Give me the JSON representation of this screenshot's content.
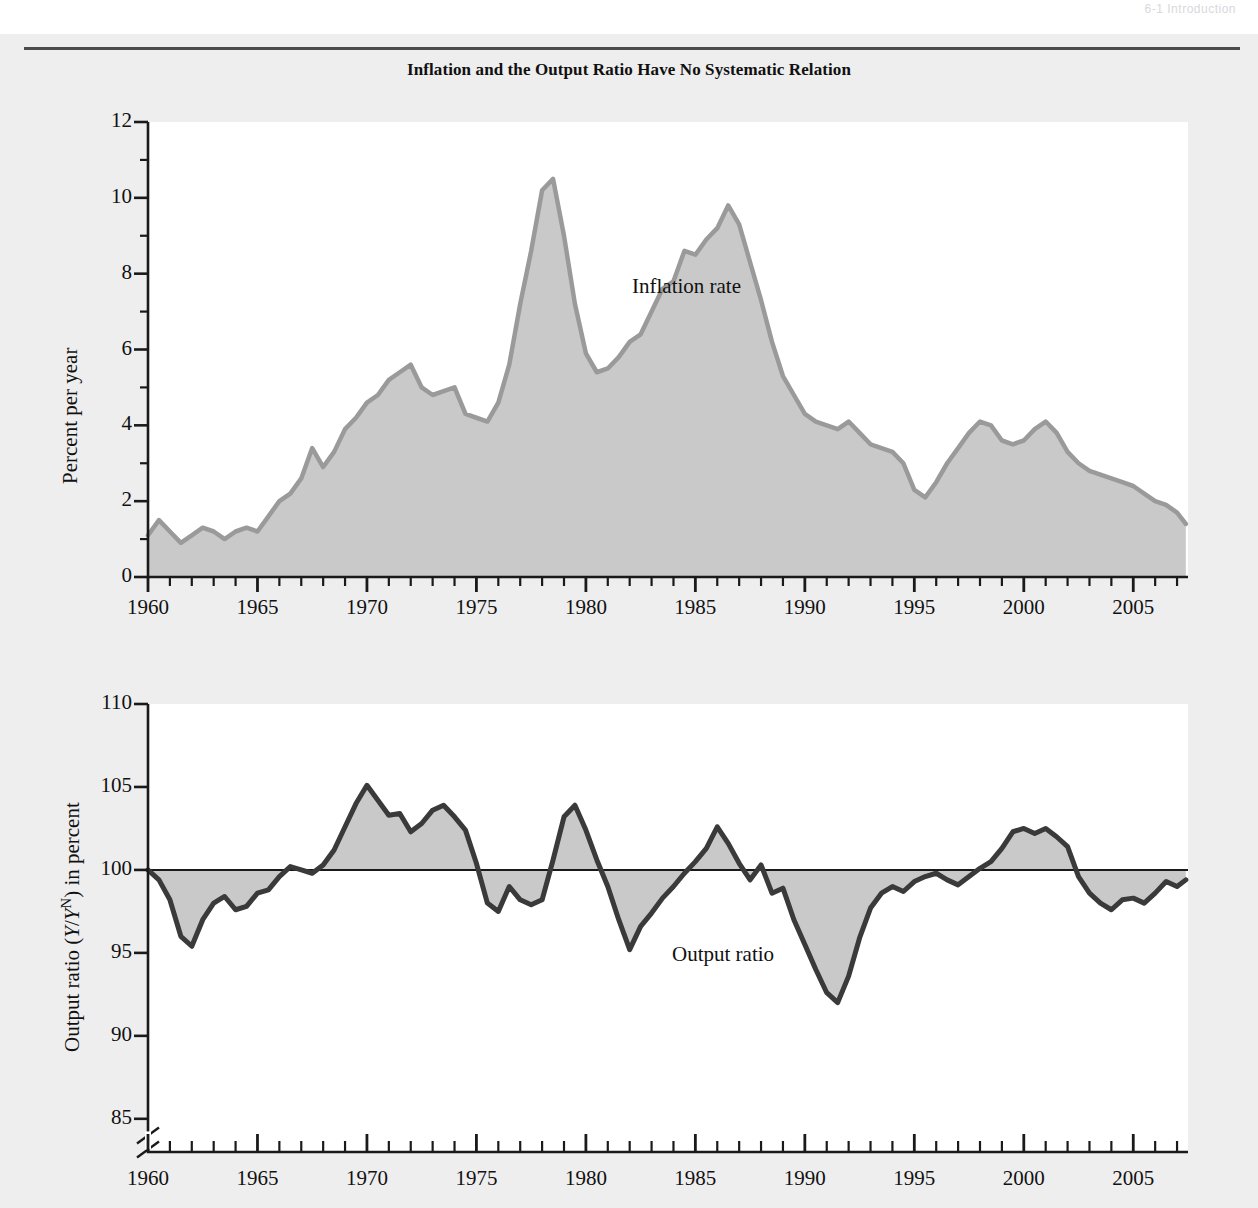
{
  "running_head": "6-1  Introduction",
  "figure": {
    "title": "Inflation and the Output Ratio Have No Systematic Relation",
    "colors": {
      "page_background": "#eeeeee",
      "panel_background": "#ffffff",
      "inflation_fill": "#c9c9c9",
      "inflation_stroke": "#9a9a9a",
      "output_fill": "#c9c9c9",
      "output_stroke": "#3a3a3a",
      "axis": "#1a1a1a",
      "baseline": "#1a1a1a"
    }
  },
  "chart_data": [
    {
      "type": "area",
      "name": "inflation-panel",
      "title": "Inflation and the Output Ratio Have No Systematic Relation",
      "xlabel": "",
      "ylabel": "Percent per year",
      "series_label": "Inflation rate",
      "xlim": [
        1960,
        2007.5
      ],
      "ylim": [
        0,
        12
      ],
      "xticks": [
        1960,
        1965,
        1970,
        1975,
        1980,
        1985,
        1990,
        1995,
        2000,
        2005
      ],
      "xtick_labels": [
        "1960",
        "1965",
        "1970",
        "1975",
        "1980",
        "1985",
        "1990",
        "1995",
        "2000",
        "2005"
      ],
      "yticks": [
        0,
        2,
        4,
        6,
        8,
        10,
        12
      ],
      "ytick_labels": [
        "0",
        "2",
        "4",
        "6",
        "8",
        "10",
        "12"
      ],
      "yminor": [
        1,
        3,
        5,
        7,
        9,
        11
      ],
      "xminor_step": 1,
      "grid": false,
      "legend": "inline-annotation",
      "x": [
        1960.0,
        1960.5,
        1961.0,
        1961.5,
        1962.0,
        1962.5,
        1963.0,
        1963.5,
        1964.0,
        1964.5,
        1965.0,
        1965.5,
        1966.0,
        1966.5,
        1967.0,
        1967.5,
        1968.0,
        1968.5,
        1969.0,
        1969.5,
        1970.0,
        1970.5,
        1971.0,
        1971.5,
        1972.0,
        1972.5,
        1973.0,
        1973.5,
        1974.0,
        1974.5,
        1975.0,
        1975.5,
        1976.0,
        1976.5,
        1977.0,
        1977.5,
        1978.0,
        1978.5,
        1979.0,
        1979.5,
        1980.0,
        1980.5,
        1981.0,
        1981.5,
        1982.0,
        1982.5,
        1983.0,
        1983.5,
        1984.0,
        1984.5,
        1985.0,
        1985.5,
        1986.0,
        1986.5,
        1987.0,
        1987.5,
        1988.0,
        1988.5,
        1989.0,
        1989.5,
        1990.0,
        1990.5,
        1991.0,
        1991.5,
        1992.0,
        1992.5,
        1993.0,
        1993.5,
        1994.0,
        1994.5,
        1995.0,
        1995.5,
        1996.0,
        1996.5,
        1997.0,
        1997.5,
        1998.0,
        1998.5,
        1999.0,
        1999.5,
        2000.0,
        2000.5,
        2001.0,
        2001.5,
        2002.0,
        2002.5,
        2003.0,
        2003.5,
        2004.0,
        2004.5,
        2005.0,
        2005.5,
        2006.0,
        2006.5,
        2007.0,
        2007.4
      ],
      "y": [
        1.1,
        1.5,
        1.2,
        0.9,
        1.1,
        1.3,
        1.2,
        1.0,
        1.2,
        1.3,
        1.2,
        1.6,
        2.0,
        2.2,
        2.6,
        3.4,
        2.9,
        3.3,
        3.9,
        4.2,
        4.6,
        4.8,
        5.2,
        5.4,
        5.6,
        5.0,
        4.8,
        4.9,
        5.0,
        4.3,
        4.2,
        4.1,
        4.6,
        5.6,
        7.2,
        8.6,
        10.2,
        10.5,
        9.0,
        7.2,
        5.9,
        5.4,
        5.5,
        5.8,
        6.2,
        6.4,
        7.0,
        7.6,
        7.8,
        8.6,
        8.5,
        8.9,
        9.2,
        9.8,
        9.3,
        8.3,
        7.3,
        6.2,
        5.3,
        4.8,
        4.3,
        4.1,
        4.0,
        3.9,
        4.1,
        3.8,
        3.5,
        3.4,
        3.3,
        3.0,
        2.3,
        2.1,
        2.5,
        3.0,
        3.4,
        3.8,
        4.1,
        4.0,
        3.6,
        3.5,
        3.6,
        3.9,
        4.1,
        3.8,
        3.3,
        3.0,
        2.8,
        2.7,
        2.6,
        2.5,
        2.4,
        2.2,
        2.0,
        1.9,
        1.7,
        1.4,
        1.2,
        1.3,
        1.7,
        2.0,
        2.2,
        2.4,
        2.6,
        2.3,
        2.7,
        2.3,
        1.9,
        2.1,
        2.4,
        2.6,
        2.9,
        3.2,
        3.5,
        3.3,
        3.5,
        3.4,
        3.2,
        2.6,
        2.8
      ]
    },
    {
      "type": "area",
      "name": "output-ratio-panel",
      "title": "",
      "xlabel": "",
      "ylabel": "Output ratio (Y/Y^N) in percent",
      "series_label": "Output ratio",
      "xlim": [
        1960,
        2007.5
      ],
      "ylim": [
        83,
        110
      ],
      "baseline": 100,
      "axis_break_below": 85,
      "xticks": [
        1960,
        1965,
        1970,
        1975,
        1980,
        1985,
        1990,
        1995,
        2000,
        2005
      ],
      "xtick_labels": [
        "1960",
        "1965",
        "1970",
        "1975",
        "1980",
        "1985",
        "1990",
        "1995",
        "2000",
        "2005"
      ],
      "yticks": [
        85,
        90,
        95,
        100,
        105,
        110
      ],
      "ytick_labels": [
        "85",
        "90",
        "95",
        "100",
        "105",
        "110"
      ],
      "xminor_step": 1,
      "grid": false,
      "legend": "inline-annotation",
      "x": [
        1960.0,
        1960.5,
        1961.0,
        1961.5,
        1962.0,
        1962.5,
        1963.0,
        1963.5,
        1964.0,
        1964.5,
        1965.0,
        1965.5,
        1966.0,
        1966.5,
        1967.0,
        1967.5,
        1968.0,
        1968.5,
        1969.0,
        1969.5,
        1970.0,
        1970.5,
        1971.0,
        1971.5,
        1972.0,
        1972.5,
        1973.0,
        1973.5,
        1974.0,
        1974.5,
        1975.0,
        1975.5,
        1976.0,
        1976.5,
        1977.0,
        1977.5,
        1978.0,
        1978.5,
        1979.0,
        1979.5,
        1980.0,
        1980.5,
        1981.0,
        1981.5,
        1982.0,
        1982.5,
        1983.0,
        1983.5,
        1984.0,
        1984.5,
        1985.0,
        1985.5,
        1986.0,
        1986.5,
        1987.0,
        1987.5,
        1988.0,
        1988.5,
        1989.0,
        1989.5,
        1990.0,
        1990.5,
        1991.0,
        1991.5,
        1992.0,
        1992.5,
        1993.0,
        1993.5,
        1994.0,
        1994.5,
        1995.0,
        1995.5,
        1996.0,
        1996.5,
        1997.0,
        1997.5,
        1998.0,
        1998.5,
        1999.0,
        1999.5,
        2000.0,
        2000.5,
        2001.0,
        2001.5,
        2002.0,
        2002.5,
        2003.0,
        2003.5,
        2004.0,
        2004.5,
        2005.0,
        2005.5,
        2006.0,
        2006.5,
        2007.0,
        2007.4
      ],
      "y": [
        100.0,
        99.4,
        98.2,
        96.0,
        95.4,
        97.0,
        98.0,
        98.4,
        97.6,
        97.8,
        98.6,
        98.8,
        99.6,
        100.2,
        100.0,
        99.8,
        100.3,
        101.2,
        102.6,
        104.0,
        105.1,
        104.2,
        103.3,
        103.4,
        102.3,
        102.8,
        103.6,
        103.9,
        103.2,
        102.4,
        100.4,
        98.0,
        97.5,
        99.0,
        98.2,
        97.9,
        98.2,
        100.6,
        103.2,
        103.9,
        102.4,
        100.6,
        99.0,
        97.0,
        95.2,
        96.6,
        97.4,
        98.3,
        99.0,
        99.8,
        100.5,
        101.3,
        102.6,
        101.6,
        100.4,
        99.4,
        100.3,
        98.6,
        98.9,
        97.0,
        95.5,
        94.0,
        92.6,
        92.0,
        93.6,
        95.9,
        97.7,
        98.6,
        99.0,
        98.7,
        99.3,
        99.6,
        99.8,
        99.4,
        99.1,
        99.6,
        100.1,
        100.5,
        101.3,
        102.3,
        102.5,
        102.2,
        102.5,
        102.0,
        101.4,
        99.6,
        98.6,
        98.0,
        97.6,
        98.2,
        98.3,
        98.0,
        98.6,
        99.3,
        99.0,
        99.4,
        99.8,
        100.6,
        101.2,
        101.8,
        103.0,
        103.4,
        104.0,
        103.8,
        103.2,
        102.0,
        100.6,
        99.4,
        98.6,
        99.2,
        99.9,
        100.2,
        100.4,
        100.1,
        99.8,
        100.2,
        100.5,
        100.0,
        100.4
      ]
    }
  ],
  "annotations": {
    "inflation_label": "Inflation rate",
    "output_label": "Output ratio",
    "output_ylabel_prefix": "Output ratio (",
    "output_ylabel_var1": "Y",
    "output_ylabel_slash": "/",
    "output_ylabel_var2": "Y",
    "output_ylabel_sup": "N",
    "output_ylabel_suffix": ") in percent",
    "inflation_ylabel": "Percent per year"
  }
}
